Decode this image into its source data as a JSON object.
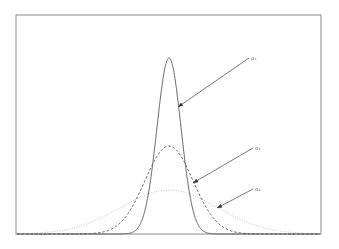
{
  "chart_data": {
    "type": "line",
    "title": "",
    "xlabel": "",
    "ylabel": "",
    "grid": false,
    "axes_ticks": false,
    "x_range": [
      -6,
      6
    ],
    "series": [
      {
        "name": "σ1",
        "sigma": 1,
        "style": "solid",
        "color": "#555555",
        "relative_peak": 1.0
      },
      {
        "name": "σ2",
        "sigma": 2,
        "style": "dashed",
        "color": "#333333",
        "relative_peak": 0.5
      },
      {
        "name": "σ3",
        "sigma": 4,
        "style": "dotted",
        "color": "#aaaaaa",
        "relative_peak": 0.25
      }
    ],
    "annotations": [
      {
        "text": "σ1",
        "target_series": "σ1",
        "label_pos": [
          251,
          57
        ],
        "arrow_tip": [
          178,
          107
        ]
      },
      {
        "text": "σ2",
        "target_series": "σ2",
        "label_pos": [
          255,
          147
        ],
        "arrow_tip": [
          193,
          183
        ]
      },
      {
        "text": "σ3",
        "target_series": "σ3",
        "label_pos": [
          255,
          188
        ],
        "arrow_tip": [
          217,
          208
        ]
      }
    ]
  },
  "plot": {
    "left": 16,
    "top": 15,
    "right": 321,
    "bottom": 234,
    "center_x": 169,
    "px_per_sigma_unit": 12,
    "peak_height_px": 176,
    "frame_color": "#888888"
  },
  "labels": {
    "sigma1": "σ₁",
    "sigma2": "σ₂",
    "sigma3": "σ₃"
  }
}
